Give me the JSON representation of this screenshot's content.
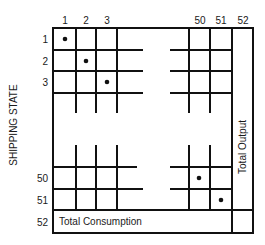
{
  "diagram": {
    "type": "input-output matrix",
    "row_axis_label": "SHIPPING STATE",
    "column_labels": [
      "1",
      "2",
      "3",
      "50",
      "51",
      "52"
    ],
    "row_labels": [
      "1",
      "2",
      "3",
      "50",
      "51",
      "52"
    ],
    "total_row_label": "Total Consumption",
    "total_column_label": "Total Output",
    "diagonal_marked_cells": [
      "1,1",
      "2,2",
      "3,3",
      "50,50",
      "51,51"
    ],
    "colors": {
      "line": "#111111",
      "background": "#ffffff",
      "text": "#1a1a1a"
    }
  }
}
